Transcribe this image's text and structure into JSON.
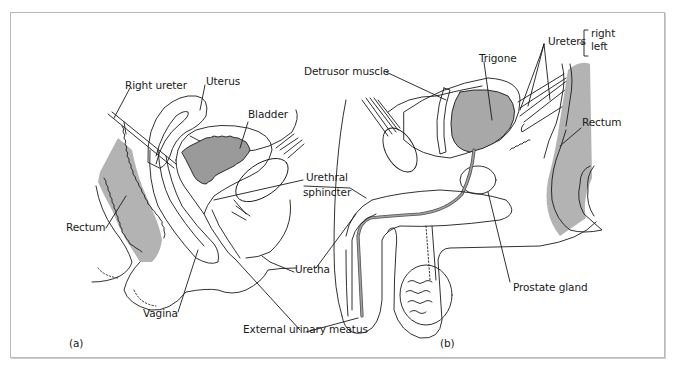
{
  "figure": {
    "panels": [
      {
        "id": "a",
        "panel_label": "(a)",
        "labels": {
          "right_ureter": "Right ureter",
          "uterus": "Uterus",
          "bladder": "Bladder",
          "urethral_sphincter_line1": "Urethral",
          "urethral_sphincter_line2": "sphincter",
          "rectum": "Rectum",
          "uretha": "Uretha",
          "vagina": "Vagina",
          "external_urinary_meatus": "External urinary meatus"
        }
      },
      {
        "id": "b",
        "panel_label": "(b)",
        "labels": {
          "detrusor_muscle": "Detrusor muscle",
          "trigone": "Trigone",
          "ureters": "Ureters",
          "ureters_right": "right",
          "ureters_left": "left",
          "rectum": "Rectum",
          "prostate_gland": "Prostate gland"
        }
      }
    ],
    "colors": {
      "line": "#1a1a1a",
      "shading": "#b3b3b3",
      "border": "#b8b8b8",
      "background": "#ffffff"
    }
  }
}
